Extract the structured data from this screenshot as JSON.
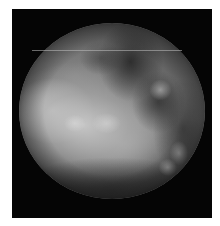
{
  "image": {
    "subject": "grayscale planetary disc",
    "description": "Low-resolution grayscale image of a planetary body on a black background, with bright regions on the left-center and darker patches toward the upper right and bottom.",
    "colors": {
      "background": "#050505",
      "border": "#ffffff",
      "disc_mid": "#6a6a6a",
      "disc_bright": "#e0e0e0",
      "disc_dark": "#2e2e2e"
    },
    "features": [
      {
        "name": "bright-region",
        "location": "left-center"
      },
      {
        "name": "dark-region",
        "location": "upper-right"
      },
      {
        "name": "dark-band",
        "location": "bottom"
      },
      {
        "name": "scan-line-artifact",
        "location": "upper disc, horizontal"
      }
    ]
  }
}
